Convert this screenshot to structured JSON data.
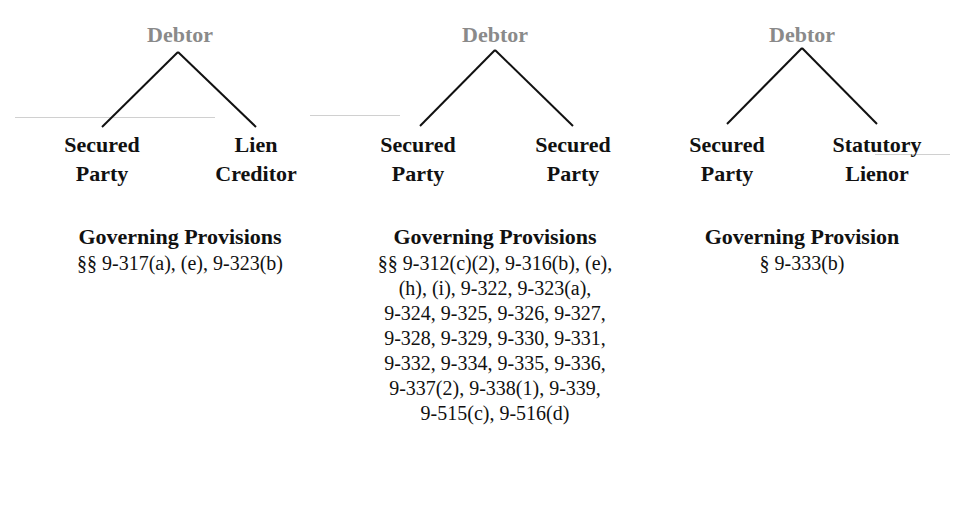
{
  "diagrams": [
    {
      "root": "Debtor",
      "left_node": [
        "Secured",
        "Party"
      ],
      "right_node": [
        "Lien",
        "Creditor"
      ],
      "heading": "Governing Provisions",
      "provisions": [
        "§§ 9-317(a), (e), 9-323(b)"
      ]
    },
    {
      "root": "Debtor",
      "left_node": [
        "Secured",
        "Party"
      ],
      "right_node": [
        "Secured",
        "Party"
      ],
      "heading": "Governing Provisions",
      "provisions": [
        "§§ 9-312(c)(2), 9-316(b), (e),",
        "(h), (i), 9-322, 9-323(a),",
        "9-324, 9-325, 9-326, 9-327,",
        "9-328, 9-329, 9-330, 9-331,",
        "9-332, 9-334, 9-335, 9-336,",
        "9-337(2), 9-338(1), 9-339,",
        "9-515(c), 9-516(d)"
      ]
    },
    {
      "root": "Debtor",
      "left_node": [
        "Secured",
        "Party"
      ],
      "right_node": [
        "Statutory",
        "Lienor"
      ],
      "heading": "Governing Provision",
      "provisions": [
        "§ 9-333(b)"
      ]
    }
  ],
  "colors": {
    "root_text": "#8a8a8a",
    "text": "#111111",
    "lines": "#111111"
  }
}
